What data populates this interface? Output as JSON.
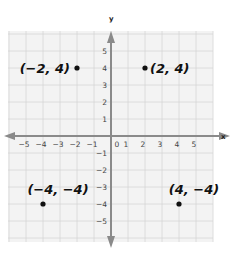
{
  "chart_data": {
    "type": "scatter",
    "title": "",
    "xlabel": "x",
    "ylabel": "y",
    "xlim": [
      -6,
      6
    ],
    "ylim": [
      -6,
      6
    ],
    "grid": true,
    "x_ticks": [
      -5,
      -4,
      -3,
      -2,
      -1,
      0,
      1,
      2,
      3,
      4,
      5
    ],
    "y_ticks": [
      -5,
      -4,
      -3,
      -2,
      -1,
      1,
      2,
      3,
      4,
      5
    ],
    "x_tick_labels": [
      "−5",
      "−4",
      "−3",
      "−2",
      "−1",
      "0",
      "1",
      "2",
      "3",
      "4",
      "5"
    ],
    "y_tick_labels": [
      "−5",
      "−4",
      "−3",
      "−2",
      "−1",
      "1",
      "2",
      "3",
      "4",
      "5"
    ],
    "points": [
      {
        "x": -2,
        "y": 4,
        "label": "(−2, 4)",
        "label_side": "left"
      },
      {
        "x": 2,
        "y": 4,
        "label": "(2, 4)",
        "label_side": "right"
      },
      {
        "x": -4,
        "y": -4,
        "label": "(−4, −4)",
        "label_side": "above"
      },
      {
        "x": 4,
        "y": -4,
        "label": "(4, −4)",
        "label_side": "above"
      }
    ],
    "colors": {
      "grid_bg": "#f3f3f3",
      "grid_line": "#d6d6d6",
      "axis": "#8a8a8a",
      "point": "#111111"
    }
  }
}
